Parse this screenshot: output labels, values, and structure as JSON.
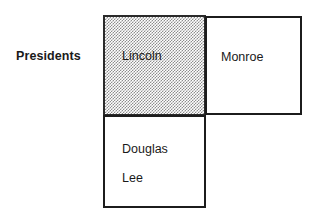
{
  "diagram": {
    "row_label": "Presidents",
    "cells": [
      {
        "id": "lincoln",
        "text": "Lincoln",
        "shaded": true,
        "fill": "#8d8d8d",
        "border": "#2a2a2a"
      },
      {
        "id": "monroe",
        "text": "Monroe",
        "shaded": false,
        "fill": "#ffffff",
        "border": "#1c1c1c"
      },
      {
        "id": "lower",
        "lines": [
          "Douglas",
          "Lee"
        ],
        "shaded": false,
        "fill": "#ffffff",
        "border": "#1c1c1c"
      }
    ]
  },
  "colors": {
    "background": "#ffffff",
    "ink": "#1a1a1a",
    "shade": "#8d8d8d"
  }
}
